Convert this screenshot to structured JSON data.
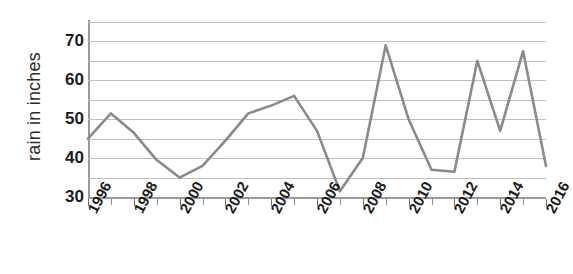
{
  "chart_data": {
    "type": "line",
    "title": "",
    "xlabel": "",
    "ylabel": "rain in inches",
    "x": [
      1996,
      1997,
      1998,
      1999,
      2000,
      2001,
      2002,
      2003,
      2004,
      2005,
      2006,
      2007,
      2008,
      2009,
      2010,
      2011,
      2012,
      2013,
      2014,
      2015,
      2016
    ],
    "values": [
      45,
      51.5,
      46.5,
      39.5,
      35,
      38,
      44.5,
      51.5,
      53.5,
      56,
      47,
      31.5,
      40,
      69,
      50,
      37,
      36.5,
      65,
      47,
      67.5,
      38
    ],
    "series": [
      {
        "name": "rain in inches",
        "values": [
          45,
          51.5,
          46.5,
          39.5,
          35,
          38,
          44.5,
          51.5,
          53.5,
          56,
          47,
          31.5,
          40,
          69,
          50,
          37,
          36.5,
          65,
          47,
          67.5,
          38
        ]
      }
    ],
    "ylim": [
      30,
      75
    ],
    "xlim": [
      1996,
      2016
    ],
    "y_tick_labels": [
      "30",
      "40",
      "50",
      "60",
      "70"
    ],
    "y_tick_values": [
      30,
      40,
      50,
      60,
      70
    ],
    "gridline_values": [
      35,
      40,
      45,
      50,
      55,
      60,
      65,
      70,
      75
    ],
    "x_tick_labels": [
      "1996",
      "1998",
      "2000",
      "2002",
      "2004",
      "2006",
      "2008",
      "2010",
      "2012",
      "2014",
      "2016"
    ],
    "x_tick_values": [
      1996,
      1998,
      2000,
      2002,
      2004,
      2006,
      2008,
      2010,
      2012,
      2014,
      2016
    ],
    "grid": true,
    "legend": false,
    "line_color": "#8a8a8a",
    "grid_color": "#bfbfbf",
    "axis_color": "#9a9a9a",
    "text_color": "#1c1c1c"
  }
}
